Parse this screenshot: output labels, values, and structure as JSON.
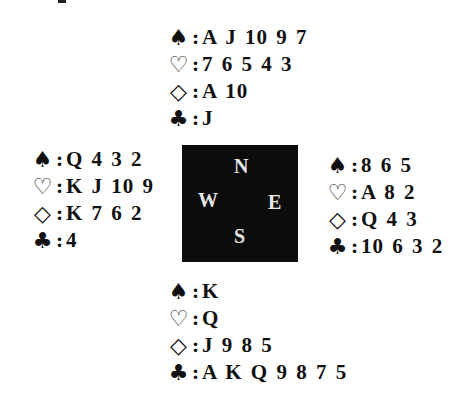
{
  "symbols": {
    "spades": "♠",
    "hearts": "♡",
    "diamonds": "◇",
    "clubs": "♣",
    "separator": ":"
  },
  "hands": {
    "north": {
      "spades": "A J 10 9 7",
      "hearts": "7 6 5 4 3",
      "diamonds": "A 10",
      "clubs": "J"
    },
    "west": {
      "spades": "Q 4 3 2",
      "hearts": "K J 10 9",
      "diamonds": "K 7 6 2",
      "clubs": "4"
    },
    "east": {
      "spades": "8 6 5",
      "hearts": "A 8 2",
      "diamonds": "Q 4 3",
      "clubs": "10 6 3 2"
    },
    "south": {
      "spades": "K",
      "hearts": "Q",
      "diamonds": "J 9 8 5",
      "clubs": "A K Q 9 8 7 5"
    }
  },
  "compass": {
    "north": "N",
    "west": "W",
    "east": "E",
    "south": "S"
  },
  "colors": {
    "background": "#ffffff",
    "text": "#111111",
    "compass_bg": "#0c0c0c",
    "compass_text": "#e8e8e8"
  }
}
